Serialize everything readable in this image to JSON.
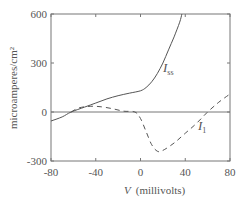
{
  "chart_data": {
    "type": "line",
    "title": "",
    "xlabel_var": "V",
    "xlabel_unit": "(millivolts)",
    "ylabel": "microamperes/cm²",
    "xlim": [
      -80,
      80
    ],
    "ylim": [
      -300,
      600
    ],
    "x_ticks": [
      "-80",
      "-40",
      "0",
      "40",
      "80"
    ],
    "y_ticks": [
      "-300",
      "0",
      "300",
      "600"
    ],
    "grid": false,
    "zero_line": true,
    "series": [
      {
        "name": "I_ss",
        "label_main": "I",
        "label_sub": "ss",
        "style": "solid",
        "x": [
          -80,
          -70,
          -62,
          -50,
          -40,
          -30,
          -20,
          -10,
          0,
          5,
          10,
          15,
          20,
          25,
          30,
          35,
          37
        ],
        "y": [
          -55,
          -30,
          0,
          30,
          55,
          80,
          100,
          115,
          130,
          150,
          185,
          235,
          300,
          380,
          460,
          550,
          600
        ]
      },
      {
        "name": "I_1",
        "label_main": "I",
        "label_sub": "1",
        "style": "dashed",
        "x": [
          -62,
          -55,
          -45,
          -35,
          -25,
          -15,
          -5,
          0,
          5,
          10,
          15,
          20,
          30,
          40,
          50,
          60,
          70,
          80
        ],
        "y": [
          0,
          25,
          35,
          32,
          20,
          5,
          0,
          -40,
          -120,
          -200,
          -240,
          -235,
          -190,
          -130,
          -70,
          0,
          60,
          110
        ]
      }
    ]
  }
}
